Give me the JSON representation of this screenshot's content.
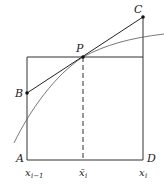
{
  "diagram": {
    "points": {
      "A": "A",
      "B": "B",
      "C": "C",
      "D": "D",
      "P": "P"
    },
    "axis_labels": {
      "left": "x",
      "left_sub": "i−1",
      "mid": "x̄",
      "mid_sub": "i",
      "right": "x",
      "right_sub": "i"
    }
  }
}
